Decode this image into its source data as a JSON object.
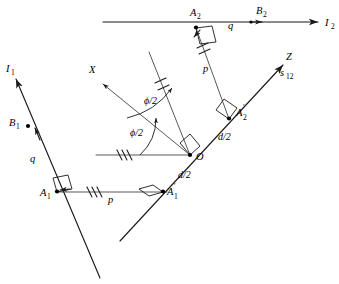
{
  "figure": {
    "background_color": "#ffffff",
    "line_color": "#1a1a1a",
    "width": 339,
    "height": 284
  },
  "labels": {
    "line1_name": "I",
    "line1_sub": "1",
    "line2_name": "I",
    "line2_sub": "2",
    "axis_x": "X",
    "axis_z": "Z",
    "screw_axis": "s",
    "screw_axis_sub": "12",
    "point_A1": "A",
    "point_A1_sub": "1",
    "point_A1p": "A",
    "point_A1p_sub": "1",
    "point_A2": "A",
    "point_A2_sub": "2",
    "point_A2p": "A",
    "point_A2p_sub": "2",
    "point_B1": "B",
    "point_B1_sub": "1",
    "point_B2": "B",
    "point_B2_sub": "2",
    "origin": "O",
    "seg_q_left": "q",
    "seg_q_top": "q",
    "seg_p_bottom": "p",
    "seg_p_right": "p",
    "half_d_upper": "d/2",
    "half_d_lower": "d/2",
    "half_phi_inner": "ϕ/2",
    "half_phi_outer": "ϕ/2",
    "prime_mark": "′"
  },
  "geometry": {
    "origin_point": [
      190,
      155
    ],
    "line_I2": {
      "from": [
        103,
        22
      ],
      "to": [
        325,
        22
      ],
      "arrow": true
    },
    "line_I1": {
      "from": [
        14,
        74
      ],
      "to": [
        100,
        278
      ],
      "arrow_at": "from"
    },
    "axis_Z": {
      "from": [
        120,
        240
      ],
      "to": [
        288,
        60
      ],
      "arrow_at": "to"
    },
    "axis_X": {
      "from": [
        190,
        155
      ],
      "to": [
        98,
        80
      ],
      "arrow_at": "to"
    },
    "bisector_line": {
      "from": [
        190,
        155
      ],
      "to": [
        148,
        52
      ]
    },
    "horizontal_ref": {
      "from": [
        98,
        155
      ],
      "to": [
        190,
        155
      ]
    },
    "seg_A1_A1p": {
      "from": [
        57,
        192
      ],
      "to": [
        163,
        192
      ]
    },
    "seg_A2_A2p": {
      "from": [
        196,
        28
      ],
      "to": [
        228,
        118
      ]
    },
    "points": {
      "A1": [
        57,
        192
      ],
      "A1p": [
        163,
        192
      ],
      "A2": [
        196,
        27
      ],
      "A2p": [
        228,
        118
      ],
      "B1": [
        33,
        124
      ],
      "B2": [
        258,
        22
      ],
      "O": [
        190,
        155
      ]
    },
    "tick_groups": {
      "triple_horizontal_ref": 3,
      "triple_bottom_p": 3,
      "double_bisector": 2,
      "double_p_right": 2
    }
  },
  "annotations": {
    "right_angle_markers": [
      "A1",
      "A1p",
      "A2",
      "A2p",
      "O"
    ],
    "angle_arcs": 2,
    "tick_marks_meaning": "equal-length segment indicators"
  }
}
